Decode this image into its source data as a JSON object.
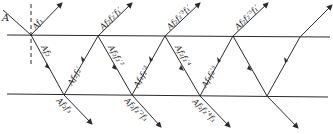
{
  "diagram": {
    "incident_label": "A",
    "colors": {
      "line": "#2a2a2a",
      "background": "#ffffff"
    },
    "surfaces": {
      "top_y": 35,
      "bottom_y": 95
    },
    "top_vertices_x": [
      31,
      98,
      165,
      233,
      300
    ],
    "bottom_vertices_x": [
      64,
      132,
      200,
      267
    ],
    "labels": {
      "reflected_top": [
        "Af₁",
        "Af₂f₂′f₁′",
        "Af₂f₂′³f₁′",
        "Af₂f₂′⁵f₁′"
      ],
      "down_inside": [
        "Af₂",
        "Af₂f₂′²",
        "Af₂f₂′⁴"
      ],
      "up_inside": [
        "Af₂f₂′",
        "Af₂f₂′³",
        "Af₂f₂′⁵"
      ],
      "transmitted_bottom": [
        "Af₂f₃",
        "Af₂f₂′²f₃",
        "Af₂f₂′⁴f₃"
      ]
    }
  }
}
